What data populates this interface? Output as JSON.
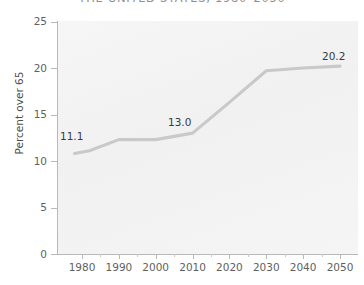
{
  "chart_data": {
    "type": "line",
    "title": "THE UNITED STATES, 1980–2050",
    "xlabel": "",
    "ylabel": "Percent over 65",
    "xlim": [
      1976,
      2052
    ],
    "ylim": [
      0,
      26
    ],
    "xticks": [
      1980,
      1990,
      2000,
      2010,
      2020,
      2030,
      2040,
      2050
    ],
    "xticklabels": [
      "1980",
      "1990",
      "2000",
      "2010",
      "2020",
      "2030",
      "2040",
      "2050"
    ],
    "x_minor_ticks": [
      1985,
      1995,
      2005,
      2015,
      2025,
      2035,
      2045
    ],
    "yticks": [
      0,
      5,
      10,
      15,
      20,
      25
    ],
    "yticklabels": [
      "0",
      "5",
      "10",
      "15",
      "20",
      "25"
    ],
    "grid": false,
    "legend": false,
    "line_color": "#c9c9c9",
    "panel_color": "#f3f3f3",
    "series": [
      {
        "name": "Percent over 65",
        "x": [
          1978,
          1982,
          1990,
          2000,
          2010,
          2020,
          2030,
          2040,
          2050
        ],
        "values": [
          10.8,
          11.1,
          12.3,
          12.3,
          13.0,
          16.3,
          19.7,
          20.0,
          20.2
        ]
      }
    ],
    "annotations": [
      {
        "label": "11.1",
        "x": 1982,
        "y": 11.1
      },
      {
        "label": "13.0",
        "x": 2010,
        "y": 13.0
      },
      {
        "label": "20.2",
        "x": 2050,
        "y": 20.2
      }
    ]
  },
  "axis": {
    "y_title": "Percent over 65",
    "y_labels": [
      "25",
      "20",
      "15",
      "10",
      "5",
      "0"
    ],
    "x_labels": [
      "1980",
      "1990",
      "2000",
      "2010",
      "2020",
      "2030",
      "2040",
      "2050"
    ]
  },
  "annotations": {
    "start": "11.1",
    "middle": "13.0",
    "end": "20.2"
  },
  "title": {
    "text": "THE UNITED STATES, 1980–2050"
  }
}
